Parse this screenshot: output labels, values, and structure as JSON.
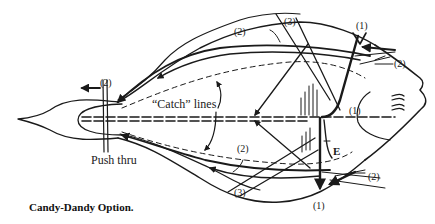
{
  "figure": {
    "caption": "Candy-Dandy Option.",
    "labels": {
      "tail_cut": "(2)",
      "top_cut": "(2)",
      "top_diagonal": "(3)",
      "top_vertical": "(1)",
      "right_upper_cut": "(2)",
      "gill_mark": "(1)",
      "catch_lines": "“Catch” lines",
      "push_thru": "Push thru",
      "bottom_cut": "(2)",
      "bottom_diagonal": "(3)",
      "e_marker": "E",
      "right_lower_cut": "(2)",
      "bottom_vertical": "(1)"
    },
    "colors": {
      "ink": "#1a1a1a",
      "background": "#ffffff"
    }
  }
}
